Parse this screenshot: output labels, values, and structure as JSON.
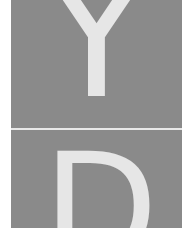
{
  "tiles": [
    {
      "letter": "Y"
    },
    {
      "letter": "D"
    }
  ],
  "colors": {
    "tile_background": "#8a8a8a",
    "glyph": "#e6e6e6",
    "page_background": "#ffffff"
  }
}
